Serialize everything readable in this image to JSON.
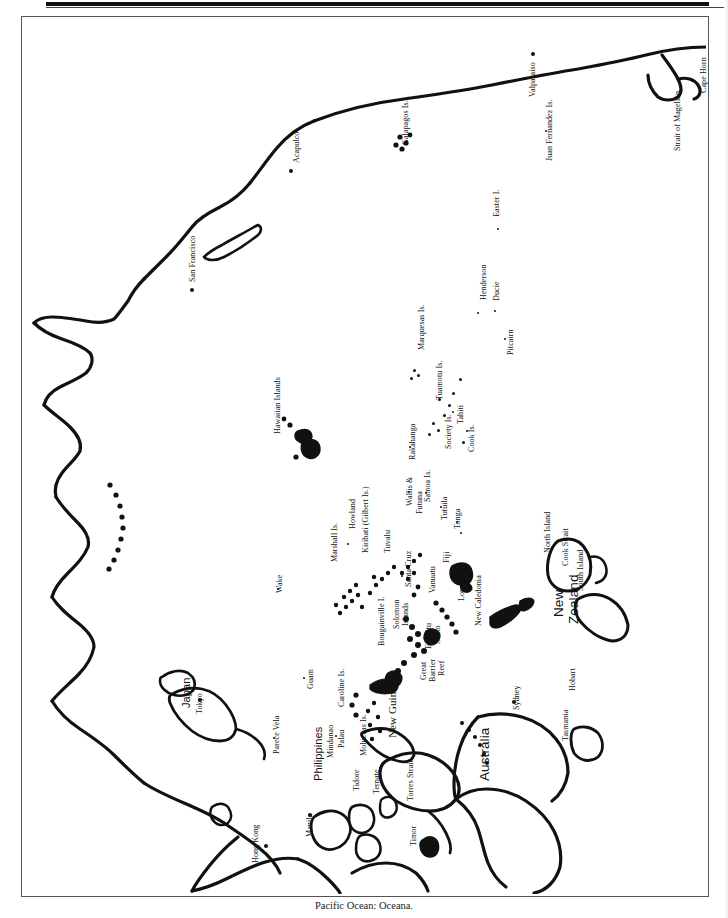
{
  "caption": "Pacific Ocean: Oceana.",
  "map": {
    "title": "Pacific Ocean: Oceana",
    "orientation": "rotated-90 (labels read bottom-to-top)",
    "frame_color": "#555555",
    "ink_color": "#111111",
    "background_color": "#ffffff"
  },
  "labels": [
    {
      "text": "Cape Horn",
      "type": "cape",
      "size": "sm",
      "x": 699,
      "y": 92
    },
    {
      "text": "Strait of Magellan",
      "type": "strait",
      "size": "sm",
      "x": 673,
      "y": 150
    },
    {
      "text": "Valparaiso",
      "type": "city",
      "size": "sm",
      "x": 528,
      "y": 96
    },
    {
      "text": "Juan Fernandez Is.",
      "type": "islands",
      "size": "sm",
      "x": 545,
      "y": 160
    },
    {
      "text": "Galapagos Is.",
      "type": "islands",
      "size": "sm",
      "x": 401,
      "y": 144
    },
    {
      "text": "Acapulco",
      "type": "city",
      "size": "sm",
      "x": 292,
      "y": 162
    },
    {
      "text": "Easter I.",
      "type": "island",
      "size": "sm",
      "x": 492,
      "y": 216
    },
    {
      "text": "San Francisco",
      "type": "city",
      "size": "sm",
      "x": 188,
      "y": 281
    },
    {
      "text": "Henderson",
      "type": "island",
      "size": "sm",
      "x": 479,
      "y": 299
    },
    {
      "text": "Ducie",
      "type": "island",
      "size": "sm",
      "x": 492,
      "y": 300
    },
    {
      "text": "Pitcairn",
      "type": "island",
      "size": "sm",
      "x": 506,
      "y": 354
    },
    {
      "text": "Marquesas Is.",
      "type": "islands",
      "size": "sm",
      "x": 417,
      "y": 349
    },
    {
      "text": "Tuamotu Is.",
      "type": "islands",
      "size": "sm",
      "x": 435,
      "y": 399
    },
    {
      "text": "Tahiti",
      "type": "island",
      "size": "sm",
      "x": 456,
      "y": 423
    },
    {
      "text": "Society Is.",
      "type": "islands",
      "size": "sm",
      "x": 444,
      "y": 448
    },
    {
      "text": "Cook Is.",
      "type": "islands",
      "size": "sm",
      "x": 467,
      "y": 451
    },
    {
      "text": "Rakahanga",
      "type": "island",
      "size": "sm",
      "x": 408,
      "y": 459
    },
    {
      "text": "Hawaiian Islands",
      "type": "islands",
      "size": "sm",
      "x": 273,
      "y": 433
    },
    {
      "text": "Howland",
      "type": "island",
      "size": "sm",
      "x": 348,
      "y": 528
    },
    {
      "text": "Kiribati (Gilbert Is.)",
      "type": "islands",
      "size": "sm",
      "x": 361,
      "y": 552
    },
    {
      "text": "Marshall Is.",
      "type": "islands",
      "size": "sm",
      "x": 330,
      "y": 561
    },
    {
      "text": "Tuvalu",
      "type": "islands",
      "size": "sm",
      "x": 383,
      "y": 552
    },
    {
      "text": "Wake",
      "type": "island",
      "size": "sm",
      "x": 275,
      "y": 592
    },
    {
      "text": "Wallis &",
      "type": "islands",
      "size": "sm",
      "x": 405,
      "y": 505
    },
    {
      "text": "Futuna",
      "type": "islands",
      "size": "sm",
      "x": 415,
      "y": 513
    },
    {
      "text": "Samoa Is.",
      "type": "islands",
      "size": "sm",
      "x": 423,
      "y": 501
    },
    {
      "text": "Tutuila",
      "type": "island",
      "size": "sm",
      "x": 440,
      "y": 519
    },
    {
      "text": "Tonga",
      "type": "islands",
      "size": "sm",
      "x": 453,
      "y": 528
    },
    {
      "text": "Fiji",
      "type": "islands",
      "size": "sm",
      "x": 442,
      "y": 562
    },
    {
      "text": "Santa Cruz",
      "type": "islands",
      "size": "sm",
      "x": 404,
      "y": 586
    },
    {
      "text": "Vanuatu",
      "type": "islands",
      "size": "sm",
      "x": 428,
      "y": 592
    },
    {
      "text": "Loyalty Is.",
      "type": "islands",
      "size": "sm",
      "x": 457,
      "y": 600
    },
    {
      "text": "New Caledonia",
      "type": "islands",
      "size": "sm",
      "x": 474,
      "y": 625
    },
    {
      "text": "Bougainville I.",
      "type": "island",
      "size": "sm",
      "x": 377,
      "y": 645
    },
    {
      "text": "Solomon",
      "type": "islands",
      "size": "sm",
      "x": 392,
      "y": 628
    },
    {
      "text": "Islands",
      "type": "islands",
      "size": "sm",
      "x": 401,
      "y": 625
    },
    {
      "text": "Espiritu",
      "type": "island",
      "size": "sm",
      "x": 424,
      "y": 648
    },
    {
      "text": "Santo",
      "type": "island",
      "size": "sm",
      "x": 433,
      "y": 643
    },
    {
      "text": "Great",
      "type": "reef",
      "size": "sm",
      "x": 419,
      "y": 679
    },
    {
      "text": "Barrier",
      "type": "reef",
      "size": "sm",
      "x": 428,
      "y": 681
    },
    {
      "text": "Reef",
      "type": "reef",
      "size": "sm",
      "x": 437,
      "y": 675
    },
    {
      "text": "New Guinea",
      "type": "island",
      "size": "med",
      "x": 386,
      "y": 737
    },
    {
      "text": "Torres Strait",
      "type": "strait",
      "size": "sm",
      "x": 406,
      "y": 800
    },
    {
      "text": "Timor",
      "type": "island",
      "size": "sm",
      "x": 409,
      "y": 845
    },
    {
      "text": "Moluccas Is.",
      "type": "islands",
      "size": "sm",
      "x": 359,
      "y": 755
    },
    {
      "text": "Tidore",
      "type": "island",
      "size": "sm",
      "x": 352,
      "y": 790
    },
    {
      "text": "Ternate",
      "type": "island",
      "size": "sm",
      "x": 372,
      "y": 793
    },
    {
      "text": "Caroline Is.",
      "type": "islands",
      "size": "sm",
      "x": 337,
      "y": 706
    },
    {
      "text": "Guam",
      "type": "island",
      "size": "sm",
      "x": 306,
      "y": 688
    },
    {
      "text": "Palau",
      "type": "island",
      "size": "sm",
      "x": 337,
      "y": 747
    },
    {
      "text": "Mindanao",
      "type": "island",
      "size": "sm",
      "x": 326,
      "y": 757
    },
    {
      "text": "Philippines",
      "type": "country",
      "size": "med",
      "x": 312,
      "y": 780
    },
    {
      "text": "Manila",
      "type": "city",
      "size": "sm",
      "x": 305,
      "y": 836
    },
    {
      "text": "Parece Vela",
      "type": "island",
      "size": "sm",
      "x": 272,
      "y": 753
    },
    {
      "text": "Hong Kong",
      "type": "city",
      "size": "sm",
      "x": 251,
      "y": 862
    },
    {
      "text": "Japan",
      "type": "country",
      "size": "med",
      "x": 180,
      "y": 707
    },
    {
      "text": "Tokyo",
      "type": "city",
      "size": "sm",
      "x": 195,
      "y": 713
    },
    {
      "text": "North Island",
      "type": "island",
      "size": "sm",
      "x": 543,
      "y": 552
    },
    {
      "text": "Cook Strait",
      "type": "strait",
      "size": "sm",
      "x": 561,
      "y": 565
    },
    {
      "text": "South Island",
      "type": "island",
      "size": "sm",
      "x": 576,
      "y": 590
    },
    {
      "text": "New",
      "type": "country",
      "size": "big",
      "x": 551,
      "y": 616
    },
    {
      "text": "Zealand",
      "type": "country",
      "size": "big",
      "x": 566,
      "y": 623
    },
    {
      "text": "Australia",
      "type": "country",
      "size": "big",
      "x": 477,
      "y": 780
    },
    {
      "text": "Sydney",
      "type": "city",
      "size": "sm",
      "x": 512,
      "y": 709
    },
    {
      "text": "Hobart",
      "type": "city",
      "size": "sm",
      "x": 568,
      "y": 690
    },
    {
      "text": "Tasmania",
      "type": "island",
      "size": "sm",
      "x": 561,
      "y": 740
    }
  ],
  "markers": [
    {
      "name": "valparaiso",
      "kind": "city",
      "x": 532,
      "y": 53
    },
    {
      "name": "acapulco",
      "kind": "city",
      "x": 290,
      "y": 170
    },
    {
      "name": "san-francisco",
      "kind": "city",
      "x": 191,
      "y": 289
    },
    {
      "name": "tokyo",
      "kind": "city",
      "x": 199,
      "y": 699
    },
    {
      "name": "hong-kong",
      "kind": "city",
      "x": 265,
      "y": 845
    },
    {
      "name": "manila",
      "kind": "city",
      "x": 309,
      "y": 814
    },
    {
      "name": "sydney",
      "kind": "city",
      "x": 513,
      "y": 701
    },
    {
      "name": "juan-fernandez",
      "kind": "tiny",
      "x": 545,
      "y": 130
    },
    {
      "name": "easter-island",
      "kind": "tiny",
      "x": 497,
      "y": 228
    },
    {
      "name": "henderson",
      "kind": "tiny",
      "x": 477,
      "y": 312
    },
    {
      "name": "ducie",
      "kind": "tiny",
      "x": 494,
      "y": 310
    },
    {
      "name": "pitcairn",
      "kind": "tiny",
      "x": 504,
      "y": 338
    },
    {
      "name": "tahiti",
      "kind": "tiny",
      "x": 452,
      "y": 411
    },
    {
      "name": "rakahanga",
      "kind": "tiny",
      "x": 409,
      "y": 446
    },
    {
      "name": "howland",
      "kind": "tiny",
      "x": 347,
      "y": 543
    },
    {
      "name": "wake",
      "kind": "tiny",
      "x": 277,
      "y": 588
    },
    {
      "name": "wallis-futuna",
      "kind": "tiny",
      "x": 408,
      "y": 491
    },
    {
      "name": "samoa",
      "kind": "tiny",
      "x": 425,
      "y": 492
    },
    {
      "name": "tutuila",
      "kind": "tiny",
      "x": 440,
      "y": 506
    },
    {
      "name": "tonga-n",
      "kind": "tiny",
      "x": 456,
      "y": 521
    },
    {
      "name": "tonga-s",
      "kind": "tiny",
      "x": 460,
      "y": 532
    },
    {
      "name": "santa-cruz",
      "kind": "tiny",
      "x": 401,
      "y": 575
    },
    {
      "name": "guam",
      "kind": "tiny",
      "x": 303,
      "y": 677
    },
    {
      "name": "palau",
      "kind": "tiny",
      "x": 335,
      "y": 735
    },
    {
      "name": "parece-vela",
      "kind": "tiny",
      "x": 273,
      "y": 737
    },
    {
      "name": "ducie-se",
      "kind": "tiny",
      "x": 466,
      "y": 430
    },
    {
      "name": "tuamotu-a",
      "kind": "spk3",
      "x": 459,
      "y": 378
    },
    {
      "name": "tuamotu-b",
      "kind": "spk3",
      "x": 452,
      "y": 392
    },
    {
      "name": "tuamotu-c",
      "kind": "spk3",
      "x": 448,
      "y": 404
    },
    {
      "name": "tuamotu-d",
      "kind": "spk3",
      "x": 438,
      "y": 398
    },
    {
      "name": "tuamotu-e",
      "kind": "spk3",
      "x": 443,
      "y": 414
    },
    {
      "name": "society-a",
      "kind": "spk3",
      "x": 432,
      "y": 422
    },
    {
      "name": "society-b",
      "kind": "spk3",
      "x": 437,
      "y": 429
    },
    {
      "name": "society-c",
      "kind": "spk3",
      "x": 428,
      "y": 433
    },
    {
      "name": "cook-a",
      "kind": "spk3",
      "x": 462,
      "y": 441
    },
    {
      "name": "marquesas-a",
      "kind": "spk3",
      "x": 413,
      "y": 369
    },
    {
      "name": "marquesas-b",
      "kind": "spk3",
      "x": 417,
      "y": 374
    },
    {
      "name": "marquesas-c",
      "kind": "spk3",
      "x": 410,
      "y": 377
    }
  ]
}
